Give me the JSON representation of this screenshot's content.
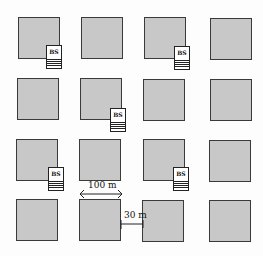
{
  "diagram": {
    "type": "Manhattan grid layout with base stations",
    "grid": {
      "rows": 4,
      "cols": 4
    },
    "colors": {
      "block_fill": "#c8c8c8",
      "block_border": "#3a3a3a",
      "background": "#fdfdfd"
    },
    "base_station_label": "BS",
    "base_stations": [
      {
        "label": "BS",
        "near_block": "row1-col1"
      },
      {
        "label": "BS",
        "near_block": "row1-col3"
      },
      {
        "label": "BS",
        "near_block": "row2-col2"
      },
      {
        "label": "BS",
        "near_block": "row3-col1"
      },
      {
        "label": "BS",
        "near_block": "row3-col3"
      }
    ],
    "dimensions": {
      "block_width": "100 m",
      "street_width": "30 m"
    }
  }
}
